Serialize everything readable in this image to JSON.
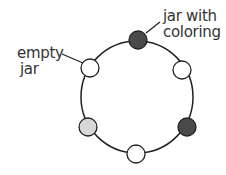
{
  "labels": {
    "colored_jar": [
      "jar with",
      "coloring"
    ],
    "empty_jar": [
      "empty",
      "jar"
    ]
  },
  "ring": {
    "cx": 137,
    "cy": 97,
    "r": 56,
    "stroke": "#222222"
  },
  "jars": [
    {
      "name": "jar-top",
      "x": 138,
      "y": 40,
      "fill": "#4a4a4a"
    },
    {
      "name": "jar-upper-right",
      "x": 182,
      "y": 70,
      "fill": "#ffffff"
    },
    {
      "name": "jar-lower-right",
      "x": 187,
      "y": 127,
      "fill": "#4a4a4a"
    },
    {
      "name": "jar-bottom",
      "x": 136,
      "y": 154,
      "fill": "#ffffff"
    },
    {
      "name": "jar-lower-left",
      "x": 88,
      "y": 127,
      "fill": "#d8d8d8"
    },
    {
      "name": "jar-upper-left",
      "x": 90,
      "y": 68,
      "fill": "#ffffff"
    }
  ]
}
